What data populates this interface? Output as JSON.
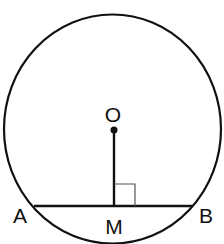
{
  "diagram": {
    "type": "circle-chord-perpendicular",
    "colors": {
      "stroke": "#111111",
      "background": "#ffffff"
    },
    "circle": {
      "cx": 112.5,
      "cy": 129,
      "rx": 108.5,
      "ry": 114.5
    },
    "center": {
      "label": "O",
      "x": 114,
      "y": 130
    },
    "chord": {
      "x1": 34,
      "y1": 206,
      "x2": 192,
      "y2": 206
    },
    "perpendicular": {
      "x1": 114,
      "y1": 130,
      "x2": 114,
      "y2": 206
    },
    "right_angle_marker": {
      "x": 114,
      "y": 184,
      "size": 21
    },
    "labels": {
      "O": "O",
      "A": "A",
      "M": "M",
      "B": "B"
    }
  }
}
